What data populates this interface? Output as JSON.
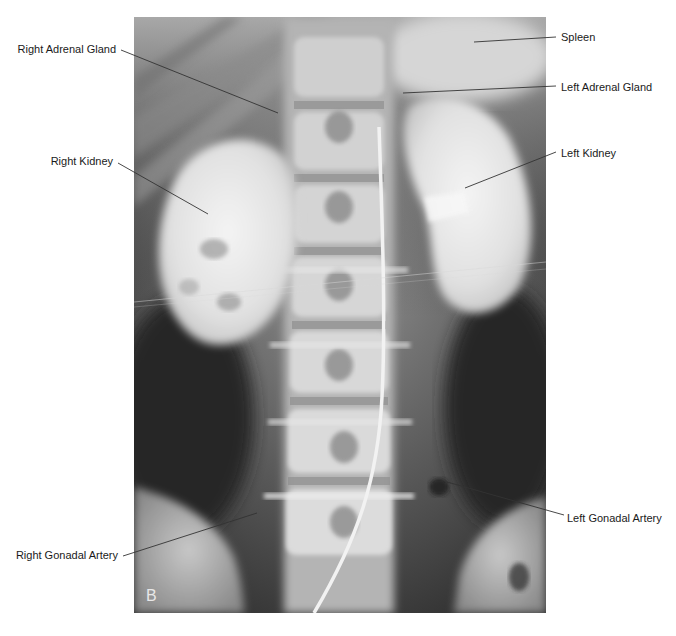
{
  "figure": {
    "panel_letter": "B",
    "image_description": "Abdominal radiograph (excretory urogram / arteriogram) showing kidneys, spine and catheter",
    "labels": {
      "right_adrenal_gland": "Right Adrenal Gland",
      "right_kidney": "Right Kidney",
      "right_gonadal_artery": "Right Gonadal Artery",
      "spleen": "Spleen",
      "left_adrenal_gland": "Left Adrenal Gland",
      "left_kidney": "Left Kidney",
      "left_gonadal_artery": "Left Gonadal Artery"
    },
    "colors": {
      "label_text": "#1a1a1a",
      "leader_line": "#333333",
      "background": "#ffffff"
    }
  }
}
